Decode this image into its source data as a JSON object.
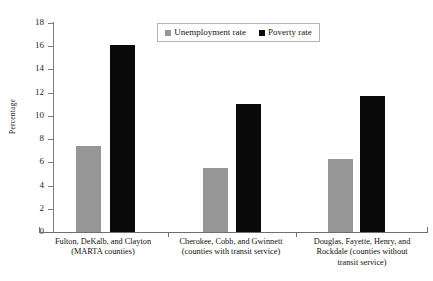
{
  "top_sliver_text": "",
  "chart_data": {
    "type": "bar",
    "title": "",
    "xlabel": "",
    "ylabel": "Percentage",
    "ylim": [
      0,
      18
    ],
    "ytick_labels": [
      "0",
      "2",
      "4",
      "6",
      "8",
      "10",
      "12",
      "14",
      "16",
      "18"
    ],
    "yticks": [
      0,
      2,
      4,
      6,
      8,
      10,
      12,
      14,
      16,
      18
    ],
    "grid": false,
    "legend_position": "top-center",
    "categories": [
      "Fulton, DeKalb, and Clayton (MARTA counties)",
      "Cherokee, Cobb, and Gwinnett (counties with transit service)",
      "Douglas, Fayette, Henry, and Rockdale (counties without transit service)"
    ],
    "category_lines": [
      [
        "Fulton, DeKalb, and Clayton",
        "(MARTA counties)"
      ],
      [
        "Cherokee, Cobb, and Gwinnett",
        "(counties with transit service)"
      ],
      [
        "Douglas, Fayette, Henry, and",
        "Rockdale (counties without",
        "transit service)"
      ]
    ],
    "series": [
      {
        "name": "Unemployment rate",
        "color": "#969696",
        "values": [
          7.4,
          5.5,
          6.3
        ]
      },
      {
        "name": "Poverty rate",
        "color": "#0a0a0a",
        "values": [
          16.1,
          11.0,
          11.7
        ]
      }
    ]
  },
  "legend": {
    "items": [
      {
        "label": "Unemployment rate",
        "swatch": "gray"
      },
      {
        "label": "Poverty rate",
        "swatch": "black"
      }
    ]
  }
}
